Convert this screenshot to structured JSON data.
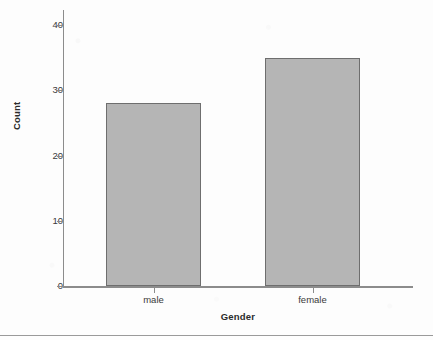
{
  "figure": {
    "width": 433,
    "height": 340,
    "background_color": "#fdfdfd",
    "bottom_rule_color": "#9a9a9a"
  },
  "chart_data": {
    "type": "bar",
    "title": "",
    "subtitle": "",
    "categories": [
      "male",
      "female"
    ],
    "values": [
      28,
      35
    ],
    "xlabel": "Gender",
    "ylabel": "Count",
    "ylim": [
      0,
      42
    ],
    "yticks": [
      0,
      10,
      20,
      30,
      40
    ],
    "ytick_labels": [
      "0",
      "10",
      "20",
      "30",
      "40"
    ],
    "xtick_labels": [
      "male",
      "female"
    ],
    "grid": false,
    "legend": null,
    "annotations": [],
    "bar_fill_color": "#b5b5b5",
    "bar_edge_color": "#6e6e6e",
    "axis_color": "#8c8c8c",
    "text_color": "#3a3a3a",
    "title_color": "#2b2b2b"
  }
}
